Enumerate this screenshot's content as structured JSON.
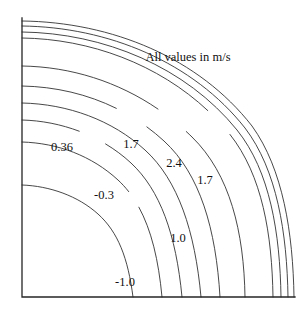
{
  "figure": {
    "background_color": "#ffffff",
    "line_color": "#333333",
    "axis_color": "#262626"
  },
  "annotation": {
    "text": "All values in m/s",
    "x": 188,
    "y": 58
  },
  "axes": {
    "name": "quarter-domain-axes",
    "origin_x": 22,
    "origin_y": 297,
    "top_y": 18,
    "right_x": 295,
    "show_top": false,
    "show_right": false,
    "ticks": false
  },
  "chart_data": {
    "type": "line",
    "subtype": "contour",
    "title": "",
    "xlabel": "",
    "ylabel": "",
    "annotations": [
      "All values in m/s"
    ],
    "units": "m/s",
    "grid": false,
    "legend": "none",
    "xlim": [
      22,
      295
    ],
    "ylim": [
      18,
      297
    ],
    "labels": [
      {
        "value": "0.36",
        "x": 62,
        "y": 148
      },
      {
        "value": "1.7",
        "x": 131,
        "y": 145
      },
      {
        "value": "2.4",
        "x": 174,
        "y": 164
      },
      {
        "value": "1.7",
        "x": 205,
        "y": 181
      },
      {
        "value": "-0.3",
        "x": 104,
        "y": 196
      },
      {
        "value": "1.0",
        "x": 178,
        "y": 239
      },
      {
        "value": "-1.0",
        "x": 125,
        "y": 283
      }
    ],
    "contour_levels": [
      "-1.0",
      "-0.3",
      "0.36",
      "1.0",
      "1.7",
      "2.4"
    ],
    "series": [
      {
        "name": "contour-1-innermost",
        "path": "M 22 185 C 50 186 78 196 98 214 C 118 232 128 258 133 297",
        "label": "-1.0"
      },
      {
        "name": "contour-2",
        "path": "M 22 142 C 58 143 92 156 118 180 C 144 204 157 243 162 297",
        "label": "-0.3",
        "gap": {
          "from": 0.52,
          "to": 0.6
        }
      },
      {
        "name": "contour-3",
        "path": "M 22 120 C 62 121 102 136 131 163 C 160 190 176 234 182 297",
        "label": "0.36",
        "gap": {
          "from": 0.22,
          "to": 0.33
        }
      },
      {
        "name": "contour-4",
        "path": "M 22 103 C 68 104 112 120 145 150 C 178 180 195 231 201 297",
        "label": "1.0"
      },
      {
        "name": "contour-5",
        "path": "M 22 86 C 76 87 126 106 164 141 C 200 174 216 229 220 297",
        "label": "1.7",
        "gap": {
          "from": 0.3,
          "to": 0.41
        }
      },
      {
        "name": "contour-6",
        "path": "M 22 66 C 86 67 146 92 192 137 C 230 174 244 232 245 297",
        "label": "2.4",
        "gap": {
          "from": 0.4,
          "to": 0.5
        }
      },
      {
        "name": "contour-7",
        "path": "M 22 38 C 100 39 178 72 228 132 C 262 173 272 233 273 297",
        "label": "1.7",
        "gap": {
          "from": 0.5,
          "to": 0.58
        }
      },
      {
        "name": "contour-8",
        "path": "M 22 32 C 104 33 186 67 237 130 C 270 171 280 233 281 297"
      },
      {
        "name": "contour-9",
        "path": "M 22 26 C 108 27 193 62 245 128 C 277 170 287 233 288 297"
      },
      {
        "name": "contour-10-outermost",
        "path": "M 22 21 C 112 22 199 58 252 126 C 283 169 293 233 294 297"
      }
    ]
  }
}
